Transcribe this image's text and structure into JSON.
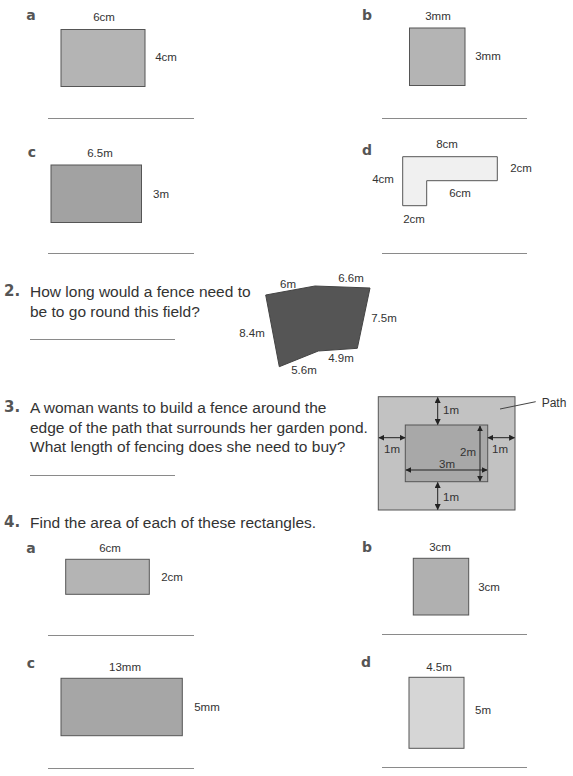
{
  "colors": {
    "rect_fill": "#b4b4b4",
    "rect_fill_dark": "#a2a2a2",
    "rect_fill_light": "#d6d6d6",
    "l_shape_fill": "#f0f0f0",
    "field_fill": "#555555",
    "path_fill": "#c2c2c2",
    "pond_fill": "#a8a8a8",
    "outline": "#555555",
    "answer_line": "#8a8a8a"
  },
  "q1": {
    "parts": [
      {
        "label": "a",
        "top": "6cm",
        "side": "4cm"
      },
      {
        "label": "b",
        "top": "3mm",
        "side": "3mm"
      },
      {
        "label": "c",
        "top": "6.5m",
        "side": "3m"
      },
      {
        "label": "d",
        "top": "8cm",
        "right": "2cm",
        "left": "4cm",
        "inner": "6cm",
        "bottom": "2cm"
      }
    ]
  },
  "q2": {
    "number": "2.",
    "lines": [
      "How long would a fence need to",
      "be to go round this field?"
    ],
    "field": {
      "side_a": "6m",
      "side_b": "6.6m",
      "side_c": "7.5m",
      "side_d": "4.9m",
      "side_e": "5.6m",
      "side_f": "8.4m"
    }
  },
  "q3": {
    "number": "3.",
    "lines": [
      "A woman wants to build a fence around the",
      "edge of the path that surrounds her garden pond.",
      "What length of fencing does she need to buy?"
    ],
    "diagram": {
      "path_label": "Path",
      "top": "1m",
      "bottom": "1m",
      "left": "1m",
      "right": "1m",
      "pond_width": "3m",
      "pond_height": "2m"
    }
  },
  "q4": {
    "number": "4.",
    "prompt": "Find the area of each of these rectangles.",
    "parts": [
      {
        "label": "a",
        "top": "6cm",
        "side": "2cm"
      },
      {
        "label": "b",
        "top": "3cm",
        "side": "3cm"
      },
      {
        "label": "c",
        "top": "13mm",
        "side": "5mm"
      },
      {
        "label": "d",
        "top": "4.5m",
        "side": "5m"
      }
    ]
  }
}
